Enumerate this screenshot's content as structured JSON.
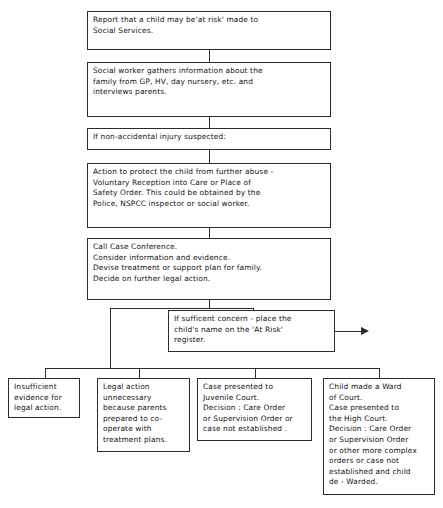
{
  "diagram": {
    "line_color": "#2b2b2b",
    "background_color": "#ffffff",
    "nodes": [
      {
        "id": "report",
        "name": "report-box",
        "text": "Report that a child may be'at risk' made to\nSocial Services."
      },
      {
        "id": "gather",
        "name": "social-worker-gathers-box",
        "text": "Social worker gathers information about the\nfamily from GP, HV, day nursery, etc. and\ninterviews parents."
      },
      {
        "id": "injury",
        "name": "non-accidental-injury-box",
        "text": "If non-accidental injury suspected:"
      },
      {
        "id": "protect",
        "name": "action-to-protect-box",
        "text": "Action to protect the child from further abuse -\nVoluntary Reception into Care or Place of\nSafety Order. This could be obtained by the\nPolice, NSPCC inspector or social worker."
      },
      {
        "id": "conference",
        "name": "call-case-conference-box",
        "text": "Call Case Conference.\nConsider information and evidence.\nDevise treatment or support plan for family.\nDecide on further legal action."
      },
      {
        "id": "register",
        "name": "at-risk-register-box",
        "text": "If sufficent concern - place the\nchild's name on the 'At Risk'\nregister."
      },
      {
        "id": "outcome1",
        "name": "insufficient-evidence-box",
        "text": "Insufficient\nevidence for\nlegal action."
      },
      {
        "id": "outcome2",
        "name": "legal-action-unnecessary-box",
        "text": "Legal action\nunnecessary\nbecause parents\nprepared to co-\noperate with\ntreatment plans."
      },
      {
        "id": "outcome3",
        "name": "juvenile-court-box",
        "text": "Case presented to\nJuvenile Court.\nDecision : Care Order\nor Supervision Order or\ncase not established ."
      },
      {
        "id": "outcome4",
        "name": "ward-of-court-box",
        "text": "Child made a Ward\nof Court.\nCase presented to\nthe High Court.\nDecision : Care Order\nor Supervision Order\nor other more complex\norders or case not\nestablished and child\nde - Warded."
      }
    ],
    "connectors": [
      {
        "name": "connector-report-to-gather"
      },
      {
        "name": "connector-gather-to-injury"
      },
      {
        "name": "connector-injury-to-protect"
      },
      {
        "name": "connector-protect-to-conference"
      },
      {
        "name": "connector-conference-to-split"
      },
      {
        "name": "connector-split-bar"
      },
      {
        "name": "connector-split-to-register"
      },
      {
        "name": "connector-split-left-drop"
      },
      {
        "name": "connector-register-right-arrow"
      },
      {
        "name": "connector-outcome-distribution-bar"
      },
      {
        "name": "connector-drop-outcome1"
      },
      {
        "name": "connector-drop-outcome2"
      },
      {
        "name": "connector-drop-outcome3"
      },
      {
        "name": "connector-drop-outcome4"
      }
    ]
  }
}
